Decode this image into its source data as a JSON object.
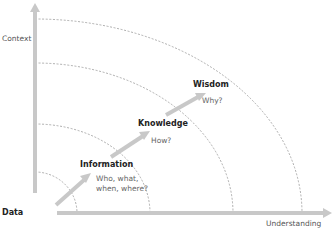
{
  "diagram": {
    "axes": {
      "y_label": "Context",
      "x_label": "Understanding"
    },
    "stages": [
      {
        "name": "Data",
        "question": ""
      },
      {
        "name": "Information",
        "question_line1": "Who, what,",
        "question_line2": "when, where?"
      },
      {
        "name": "Knowledge",
        "question": "How?"
      },
      {
        "name": "Wisdom",
        "question": "Why?"
      }
    ],
    "colors": {
      "axis": "#c8c8c8",
      "arrow": "#c8c8c8",
      "arc": "#9a9a9a",
      "title_text": "#222222",
      "question_text": "#666666"
    }
  }
}
